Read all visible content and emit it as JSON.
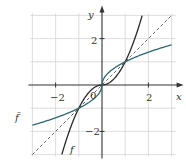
{
  "chart_data": {
    "type": "line",
    "title": "",
    "xlabel": "x",
    "ylabel": "y",
    "xlim": [
      -3,
      3
    ],
    "ylim": [
      -3,
      3
    ],
    "grid": true,
    "x_ticks": [
      {
        "value": -2,
        "label": "−2"
      },
      {
        "value": 2,
        "label": "2"
      }
    ],
    "y_ticks": [
      {
        "value": 2,
        "label": "2"
      },
      {
        "value": -2,
        "label": "−2"
      }
    ],
    "origin_label": "0",
    "series": [
      {
        "name": "f",
        "label": "f",
        "style": "solid",
        "color": "#2a2a2a",
        "formula": "x*|x|",
        "x": [
          -1.73,
          -1.5,
          -1,
          -0.5,
          0,
          0.5,
          1,
          1.5,
          1.73
        ],
        "y": [
          -3,
          -2.25,
          -1,
          -0.25,
          0,
          0.25,
          1,
          2.25,
          3
        ]
      },
      {
        "name": "f_bar",
        "label": "f̄",
        "style": "solid",
        "color": "#2f6670",
        "label_color": "#3a7a9a",
        "formula": "sign(x)*sqrt(|x|)",
        "x": [
          -3,
          -2,
          -1,
          -0.25,
          0,
          0.25,
          1,
          2,
          3
        ],
        "y": [
          -1.73,
          -1.41,
          -1,
          -0.5,
          0,
          0.5,
          1,
          1.41,
          1.73
        ]
      },
      {
        "name": "identity",
        "label": "y = x",
        "style": "dashed",
        "color": "#555555",
        "x": [
          -3,
          3
        ],
        "y": [
          -3,
          3
        ]
      }
    ],
    "intersections": [
      [
        -1,
        -1
      ],
      [
        0,
        0
      ],
      [
        1,
        1
      ]
    ]
  }
}
